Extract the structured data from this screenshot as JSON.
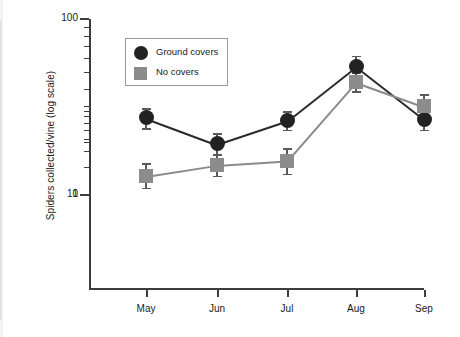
{
  "chart_data": {
    "type": "line",
    "title": "",
    "xlabel": "",
    "ylabel": "Spiders collected/vine (log scale)",
    "categories": [
      "May",
      "Jun",
      "Jul",
      "Aug",
      "Sep"
    ],
    "yscale": "log",
    "ylim": [
      1,
      100
    ],
    "ytick_labels": [
      "100",
      "10",
      "1"
    ],
    "ytick_values": [
      100,
      10,
      1
    ],
    "grid": false,
    "legend_position": "upper-left-inside",
    "series": [
      {
        "name": "Ground covers",
        "marker": "circle",
        "color": "#222222",
        "values": [
          6.8,
          19.5,
          26.5,
          54,
          27
        ],
        "err_low": [
          5.2,
          17.0,
          23.5,
          47,
          23.5
        ],
        "err_high": [
          8.6,
          22.5,
          30.0,
          62,
          31.0
        ]
      },
      {
        "name": "No covers",
        "marker": "square",
        "color": "#8c8c8c",
        "values": [
          12.8,
          14.8,
          15.7,
          44,
          32
        ],
        "err_low": [
          11.0,
          12.9,
          13.2,
          39,
          27.5
        ],
        "err_high": [
          15.2,
          17.2,
          18.4,
          50,
          37.5
        ]
      }
    ]
  },
  "legend": {
    "items": [
      {
        "label": "Ground covers",
        "marker": "circle"
      },
      {
        "label": "No covers",
        "marker": "square"
      }
    ]
  },
  "axes": {
    "y_title": "Spiders collected/vine (log scale)",
    "y_ticks": [
      {
        "label": "100",
        "value": 100
      },
      {
        "label": "10",
        "value": 10
      },
      {
        "label": "1",
        "value": 1
      }
    ],
    "x_ticks": [
      {
        "label": "May"
      },
      {
        "label": "Jun"
      },
      {
        "label": "Jul"
      },
      {
        "label": "Aug"
      },
      {
        "label": "Sep"
      }
    ]
  }
}
